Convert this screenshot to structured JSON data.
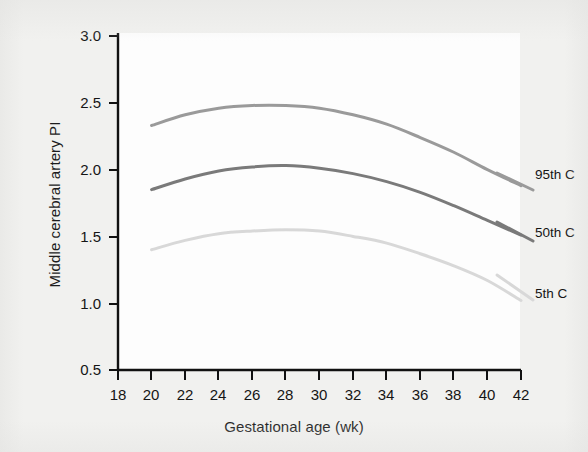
{
  "figure": {
    "background_color": "#f1f1ef",
    "plot_background_color": "#fdfdfd"
  },
  "chart_data": {
    "type": "line",
    "title": "",
    "xlabel": "Gestational age (wk)",
    "ylabel": "Middle cerebral artery PI",
    "xlim": [
      18,
      42
    ],
    "ylim": [
      0.5,
      3.0
    ],
    "xticks": [
      18,
      20,
      22,
      24,
      26,
      28,
      30,
      32,
      34,
      36,
      38,
      40,
      42
    ],
    "yticks": [
      0.5,
      1.0,
      1.5,
      2.0,
      2.5,
      3.0
    ],
    "xtick_labels": [
      "18",
      "20",
      "22",
      "24",
      "26",
      "28",
      "30",
      "32",
      "34",
      "36",
      "38",
      "40",
      "42"
    ],
    "ytick_labels": [
      "0.5",
      "1.0",
      "1.5",
      "2.0",
      "2.5",
      "3.0"
    ],
    "grid": false,
    "legend_position": "right-inline",
    "x": [
      20,
      22,
      24,
      26,
      28,
      30,
      32,
      34,
      36,
      38,
      40,
      42
    ],
    "series": [
      {
        "name": "95th C",
        "color": "#9a9a9a",
        "values": [
          2.33,
          2.41,
          2.46,
          2.48,
          2.48,
          2.46,
          2.41,
          2.34,
          2.24,
          2.13,
          2.0,
          1.88
        ]
      },
      {
        "name": "50th C",
        "color": "#7a7a7a",
        "values": [
          1.85,
          1.93,
          1.99,
          2.02,
          2.03,
          2.01,
          1.97,
          1.91,
          1.83,
          1.73,
          1.62,
          1.51
        ]
      },
      {
        "name": "5th C",
        "color": "#d8d8d8",
        "values": [
          1.4,
          1.47,
          1.52,
          1.54,
          1.55,
          1.54,
          1.5,
          1.45,
          1.37,
          1.28,
          1.17,
          1.02
        ]
      }
    ],
    "legend_entries": [
      {
        "label": "95th C",
        "color": "#9a9a9a"
      },
      {
        "label": "50th C",
        "color": "#7a7a7a"
      },
      {
        "label": "5th C",
        "color": "#d8d8d8"
      }
    ]
  }
}
